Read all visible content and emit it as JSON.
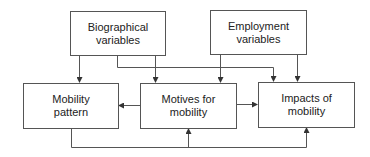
{
  "diagram": {
    "type": "flowchart",
    "colors": {
      "stroke": "#555555",
      "text": "#222222",
      "background": "#ffffff"
    },
    "nodes": [
      {
        "id": "biographical",
        "line1": "Biographical",
        "line2": "variables"
      },
      {
        "id": "employment",
        "line1": "Employment",
        "line2": "variables"
      },
      {
        "id": "mobility_pattern",
        "line1": "Mobility",
        "line2": "pattern"
      },
      {
        "id": "motives",
        "line1": "Motives for",
        "line2": "mobility"
      },
      {
        "id": "impacts",
        "line1": "Impacts of",
        "line2": "mobility"
      }
    ],
    "edges": [
      {
        "from": "biographical",
        "to": "mobility_pattern"
      },
      {
        "from": "biographical",
        "to": "motives"
      },
      {
        "from": "biographical",
        "to": "impacts"
      },
      {
        "from": "employment",
        "to": "motives"
      },
      {
        "from": "employment",
        "to": "impacts"
      },
      {
        "from": "motives",
        "to": "mobility_pattern"
      },
      {
        "from": "motives",
        "to": "impacts"
      },
      {
        "from": "mobility_pattern",
        "to": "motives"
      },
      {
        "from": "mobility_pattern",
        "to": "impacts"
      }
    ]
  }
}
